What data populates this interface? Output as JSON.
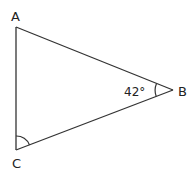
{
  "diagram": {
    "type": "triangle",
    "vertices": {
      "A": {
        "label": "A",
        "x": 16,
        "y": 27
      },
      "B": {
        "label": "B",
        "x": 173,
        "y": 90
      },
      "C": {
        "label": "C",
        "x": 16,
        "y": 150
      }
    },
    "angles": {
      "B": {
        "label": "42°",
        "marked": true
      },
      "C": {
        "label": "",
        "marked": true
      }
    },
    "colors": {
      "stroke": "#333333",
      "text": "#222222",
      "background": "#ffffff"
    }
  }
}
